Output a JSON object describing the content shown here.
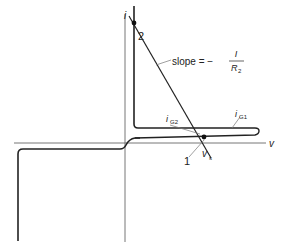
{
  "diagram": {
    "axes": {
      "y_label": "i",
      "x_label": "v"
    },
    "curves": {
      "ig1_label_main": "i",
      "ig1_label_sub": "G1",
      "ig2_label_main": "i",
      "ig2_label_sub": "G2"
    },
    "load_line": {
      "slope_text": "slope = −",
      "numerator": "I",
      "denominator_main": "R",
      "denominator_sub": "2"
    },
    "points": {
      "point1": "1",
      "point2": "2",
      "vs_main": "v",
      "vs_sub": "s"
    },
    "colors": {
      "ink": "#222222",
      "axis": "#555555",
      "leader": "#777777"
    }
  }
}
